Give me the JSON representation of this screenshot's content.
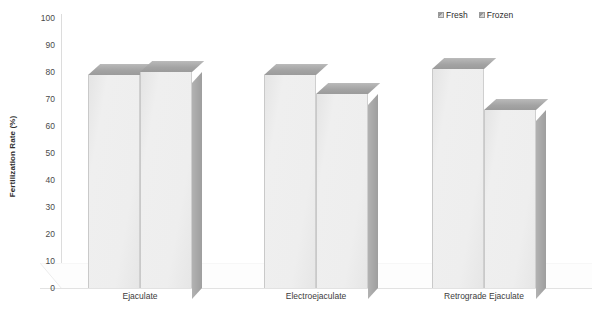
{
  "chart_data": {
    "type": "bar",
    "title": "",
    "subtitle": "",
    "xlabel": "",
    "ylabel": "Fertilization Rate (%)",
    "ylim": [
      0,
      100
    ],
    "yticks": [
      0,
      10,
      20,
      30,
      40,
      50,
      60,
      70,
      80,
      90,
      100
    ],
    "ytick_labels": [
      "0",
      "10",
      "20",
      "30",
      "40",
      "50",
      "60",
      "70",
      "80",
      "90",
      "100"
    ],
    "grid": false,
    "legend_position": "top-right",
    "style": "3d-bar",
    "categories": [
      "Ejaculate",
      "Electroejaculate",
      "Retrograde Ejaculate"
    ],
    "series": [
      {
        "name": "Fresh",
        "values": [
          79,
          79,
          81
        ]
      },
      {
        "name": "Frozen",
        "values": [
          80,
          72,
          66
        ]
      }
    ],
    "colors": {
      "bar_front": "#eeeeee",
      "bar_top": "#a3a3a3",
      "bar_side": "#a6a6a6",
      "axis": "#dcdcdc",
      "text": "#3c3c3c"
    }
  },
  "legend": {
    "items": [
      {
        "label": "Fresh",
        "icon": "legend-swatch-icon"
      },
      {
        "label": "Frozen",
        "icon": "legend-swatch-icon"
      }
    ]
  },
  "axes": {
    "y_title": "Fertilization Rate (%)"
  }
}
